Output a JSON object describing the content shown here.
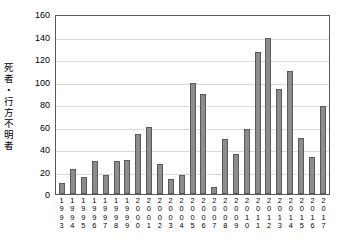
{
  "chart_data": {
    "type": "bar",
    "title": "",
    "subtitle": "",
    "xlabel": "",
    "ylabel": "死者・行方不明者",
    "ylabel_chars": [
      "死",
      "者",
      "・",
      "行",
      "方",
      "不",
      "明",
      "者"
    ],
    "ylim": [
      0,
      160
    ],
    "ytick_labels": [
      "0",
      "20",
      "40",
      "60",
      "80",
      "100",
      "120",
      "140",
      "160"
    ],
    "ytick_values": [
      0,
      20,
      40,
      60,
      80,
      100,
      120,
      140,
      160
    ],
    "grid": true,
    "grid_axis": "y",
    "legend": "none",
    "categories": [
      "1993",
      "1994",
      "1995",
      "1996",
      "1997",
      "1998",
      "1999",
      "2000",
      "2001",
      "2002",
      "2003",
      "2004",
      "2005",
      "2006",
      "2007",
      "2008",
      "2009",
      "2010",
      "2011",
      "2012",
      "2013",
      "2014",
      "2015",
      "2016",
      "2017"
    ],
    "values": [
      10,
      22,
      15,
      29,
      17,
      29,
      30,
      53,
      60,
      27,
      13,
      17,
      99,
      89,
      6,
      49,
      36,
      58,
      126,
      139,
      93,
      109,
      50,
      33,
      78
    ],
    "bar_color": "#8c8c8c",
    "bar_edge_color": "#5a5a5a",
    "plot_border_color": "#595959",
    "gridline_color": "#d9d9d9",
    "background_color": "#ffffff"
  }
}
